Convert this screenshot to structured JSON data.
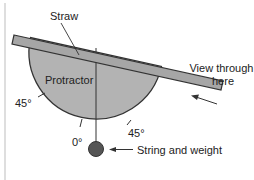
{
  "diagram": {
    "type": "labeled-apparatus",
    "labels": {
      "straw": "Straw",
      "protractor": "Protractor",
      "angle_left": "45°",
      "angle_zero": "0°",
      "angle_right": "45°",
      "view_line1": "View through",
      "view_line2": "here",
      "string_weight": "String and weight"
    },
    "colors": {
      "protractor_fill": "#b3b3b3",
      "straw_fill": "#a6a6a6",
      "outline": "#333333",
      "weight_fill": "#555555",
      "border_line": "#c8c8c8",
      "text": "#222222"
    }
  }
}
